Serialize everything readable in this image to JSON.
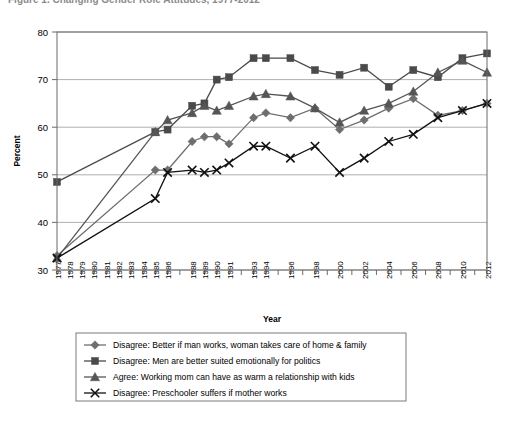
{
  "title": "Figure 1. Changing Gender Role Attitudes, 1977-2012",
  "chart_data": {
    "type": "line",
    "title": "Figure 1. Changing Gender Role Attitudes, 1977-2012",
    "xlabel": "Year",
    "ylabel": "Percent",
    "ylim": [
      30,
      80
    ],
    "ytick_labels": [
      "80",
      "70",
      "60",
      "50",
      "40",
      "30"
    ],
    "ytick_values": [
      80,
      70,
      60,
      50,
      40,
      30
    ],
    "grid": true,
    "legend_position": "below",
    "x": [
      1977,
      1978,
      1979,
      1980,
      1981,
      1982,
      1983,
      1984,
      1985,
      1986,
      1987,
      1988,
      1989,
      1990,
      1991,
      1992,
      1993,
      1994,
      1995,
      1996,
      1997,
      1998,
      1999,
      2000,
      2001,
      2002,
      2003,
      2004,
      2005,
      2006,
      2007,
      2008,
      2009,
      2010,
      2011,
      2012
    ],
    "xtick_labels": [
      "1977",
      "1978",
      "1979",
      "1980",
      "1981",
      "1982",
      "1983",
      "1984",
      "1985",
      "1986",
      "",
      "1988",
      "1989",
      "1990",
      "1991",
      "",
      "1993",
      "1994",
      "",
      "1996",
      "",
      "1998",
      "",
      "2000",
      "",
      "2002",
      "",
      "2004",
      "",
      "2006",
      "",
      "2008",
      "",
      "2010",
      "",
      "2012"
    ],
    "series": [
      {
        "name": "Disagree: Better if man works, woman takes care of home & family",
        "marker": "diamond",
        "color": "#6e6e6e",
        "values": [
          33,
          null,
          null,
          null,
          null,
          null,
          null,
          null,
          51,
          51,
          null,
          57,
          58,
          58,
          56.5,
          null,
          62,
          63,
          null,
          62,
          null,
          64,
          null,
          59.5,
          null,
          61.5,
          null,
          64,
          null,
          66,
          null,
          62.5,
          null,
          63.5,
          null,
          65
        ]
      },
      {
        "name": "Disagree: Men are better suited emotionally for politics",
        "marker": "square",
        "color": "#4a4a4a",
        "values": [
          48.5,
          null,
          null,
          null,
          null,
          null,
          null,
          null,
          59,
          59.5,
          null,
          64.5,
          65,
          70,
          70.5,
          null,
          74.5,
          74.5,
          null,
          74.5,
          null,
          72,
          null,
          71,
          null,
          72.5,
          null,
          68.5,
          null,
          72,
          null,
          70.5,
          null,
          74.5,
          null,
          75.5
        ]
      },
      {
        "name": "Agree: Working mom can have as warm a relationship with kids",
        "marker": "triangle",
        "color": "#555555",
        "values": [
          32.5,
          null,
          null,
          null,
          null,
          null,
          null,
          null,
          59,
          61.5,
          null,
          63,
          64.5,
          63.5,
          64.5,
          null,
          66.5,
          67,
          null,
          66.5,
          null,
          64,
          null,
          61,
          null,
          63.5,
          null,
          65,
          null,
          67.5,
          null,
          71.5,
          null,
          74,
          null,
          71.5
        ]
      },
      {
        "name": "Disagree: Preschooler suffers if mother works",
        "marker": "x",
        "color": "#111111",
        "values": [
          32.5,
          null,
          null,
          null,
          null,
          null,
          null,
          null,
          45,
          50.5,
          null,
          51,
          50.5,
          51,
          52.5,
          null,
          56,
          56,
          null,
          53.5,
          null,
          56,
          null,
          50.5,
          null,
          53.5,
          null,
          57,
          null,
          58.5,
          null,
          62,
          null,
          63.5,
          null,
          65
        ]
      }
    ]
  },
  "legend": {
    "items": [
      {
        "label": "Disagree: Better if man works, woman takes care of home & family",
        "marker": "diamond"
      },
      {
        "label": "Disagree: Men are better suited emotionally for politics",
        "marker": "square"
      },
      {
        "label": "Agree: Working mom can have as warm a relationship with kids",
        "marker": "triangle"
      },
      {
        "label": "Disagree: Preschooler suffers if mother works",
        "marker": "x"
      }
    ]
  },
  "colors": {
    "diamond": "#6e6e6e",
    "square": "#4a4a4a",
    "triangle": "#555555",
    "x": "#111111",
    "grid": "#9a9a9a",
    "axis": "#6b6b6b"
  }
}
